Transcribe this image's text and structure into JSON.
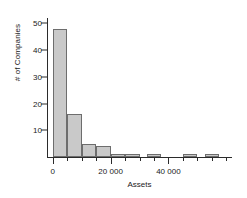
{
  "chart_data": {
    "type": "bar",
    "title": "",
    "xlabel": "Assets",
    "ylabel": "# of Companies",
    "xlim": [
      -2000,
      62000
    ],
    "ylim": [
      0,
      52
    ],
    "grid": false,
    "legend": null,
    "bin_width": 5000,
    "y_ticks": [
      10,
      20,
      30,
      40,
      50
    ],
    "y_tick_labels": [
      "10",
      "20",
      "30",
      "40",
      "50"
    ],
    "x_ticks": [
      0,
      20000,
      40000
    ],
    "x_tick_labels": [
      "0",
      "20 000",
      "40 000"
    ],
    "x_minor_ticks": [
      5000,
      10000,
      15000,
      25000,
      30000,
      35000,
      45000,
      50000,
      55000,
      60000
    ],
    "bar_fill": "#c9c9c9",
    "bar_stroke": "#6d6d6d",
    "axis_color": "#2b2b2b",
    "categories": [
      "0-5 000",
      "5 000-10 000",
      "10 000-15 000",
      "15 000-20 000",
      "20 000-25 000",
      "25 000-30 000",
      "32 500-37 500",
      "45 000-50 000",
      "52 500-57 500"
    ],
    "bin_starts": [
      0,
      5000,
      10000,
      15000,
      20000,
      25000,
      32500,
      45000,
      52500
    ],
    "bin_ends": [
      5000,
      10000,
      15000,
      20000,
      25000,
      30000,
      37500,
      50000,
      57500
    ],
    "values": [
      48,
      16,
      5,
      4,
      1,
      1,
      1,
      1,
      1
    ]
  }
}
